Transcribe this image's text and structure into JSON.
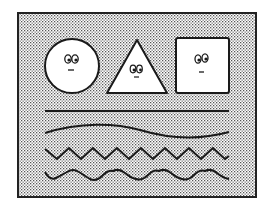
{
  "scene": {
    "background": "#ffffff",
    "frame_fill_dots": "#555555",
    "frame_stroke": "#222222",
    "shape_fill": "#ffffff",
    "stroke": "#1a1a1a"
  },
  "shapes": [
    {
      "kind": "circle",
      "name": "circle-face",
      "expression": "neutral"
    },
    {
      "kind": "triangle",
      "name": "triangle-face",
      "expression": "neutral"
    },
    {
      "kind": "square",
      "name": "square-face",
      "expression": "neutral"
    }
  ],
  "lines": [
    {
      "kind": "straight",
      "name": "straight-line"
    },
    {
      "kind": "gentle-wave",
      "name": "gentle-wave-line"
    },
    {
      "kind": "zigzag",
      "name": "zigzag-line",
      "peaks": 8
    },
    {
      "kind": "sine-wave",
      "name": "sine-wave-line",
      "cycles": 8
    }
  ]
}
